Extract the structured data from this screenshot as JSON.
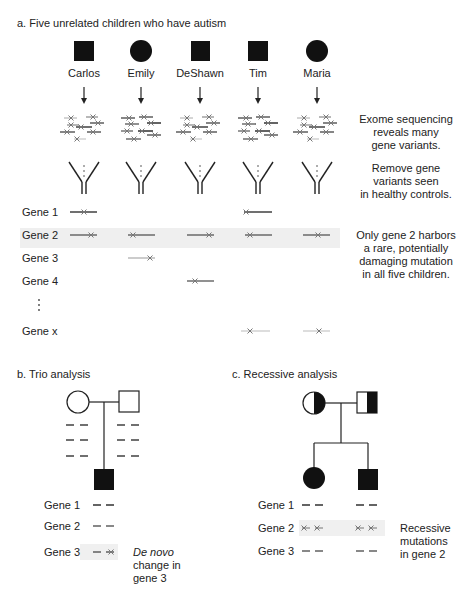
{
  "panel_a": {
    "title": "a. Five unrelated children who have autism",
    "children": [
      {
        "name": "Carlos",
        "symbol": "square-filled"
      },
      {
        "name": "Emily",
        "symbol": "circle-filled"
      },
      {
        "name": "DeShawn",
        "symbol": "square-filled"
      },
      {
        "name": "Tim",
        "symbol": "square-filled"
      },
      {
        "name": "Maria",
        "symbol": "circle-filled"
      }
    ],
    "step1_note": [
      "Exome sequencing",
      "reveals many",
      "gene variants."
    ],
    "step2_note": [
      "Remove gene",
      "variants seen",
      "in healthy controls."
    ],
    "genes": [
      "Gene 1",
      "Gene 2",
      "Gene 3",
      "Gene 4",
      "Gene x"
    ],
    "ellipsis": "⋮",
    "result_note": [
      "Only gene 2 harbors",
      "a rare, potentially",
      "damaging mutation",
      "in all five children."
    ],
    "highlight_color": "#efefef"
  },
  "panel_b": {
    "title": "b. Trio analysis",
    "genes": [
      "Gene 1",
      "Gene 2",
      "Gene 3"
    ],
    "note_italic": "De novo",
    "note_lines": [
      "change in",
      "gene 3"
    ]
  },
  "panel_c": {
    "title": "c. Recessive analysis",
    "genes": [
      "Gene 1",
      "Gene 2",
      "Gene 3"
    ],
    "note_lines": [
      "Recessive",
      "mutations",
      "in gene 2"
    ]
  }
}
